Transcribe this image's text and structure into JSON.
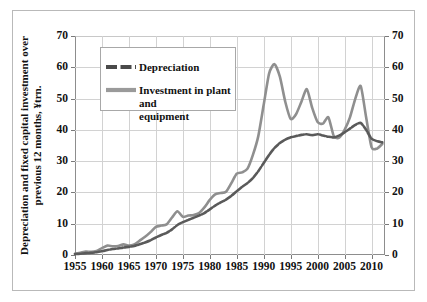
{
  "chart_data": {
    "type": "line",
    "title": "",
    "subtitle": "",
    "xlabel": "",
    "ylabel": "Depreciation and fixed capital investment over\nprevious 12 months, ¥trn.",
    "ylabel_right": "",
    "xlim": [
      1955,
      2012.5
    ],
    "ylim": [
      0,
      70
    ],
    "ytick_step": 10,
    "xtick_step": 5,
    "grid": true,
    "grid_axes": "both",
    "legend_position": "upper-left-inside",
    "dual_axis": true,
    "axis_left_ticks": [
      "0",
      "10",
      "20",
      "30",
      "40",
      "50",
      "60",
      "70"
    ],
    "axis_right_ticks": [
      "0",
      "10",
      "20",
      "30",
      "40",
      "50",
      "60",
      "70"
    ],
    "xtick_labels": [
      "1955",
      "1960",
      "1965",
      "1970",
      "1975",
      "1980",
      "1985",
      "1990",
      "1995",
      "2000",
      "2005",
      "2010"
    ],
    "xtick_values": [
      1955,
      1960,
      1965,
      1970,
      1975,
      1980,
      1985,
      1990,
      1995,
      2000,
      2005,
      2010
    ],
    "series": [
      {
        "name": "Depreciation",
        "color": "#5a5a5a",
        "style": "dashed",
        "legend_swatch": "dashed-line-swatch",
        "x": [
          1955,
          1956,
          1957,
          1958,
          1959,
          1960,
          1961,
          1962,
          1963,
          1964,
          1965,
          1966,
          1967,
          1968,
          1969,
          1970,
          1971,
          1972,
          1973,
          1974,
          1975,
          1976,
          1977,
          1978,
          1979,
          1980,
          1981,
          1982,
          1983,
          1984,
          1985,
          1986,
          1987,
          1988,
          1989,
          1990,
          1991,
          1992,
          1993,
          1994,
          1995,
          1996,
          1997,
          1998,
          1999,
          2000,
          2001,
          2002,
          2003,
          2004,
          2005,
          2006,
          2007,
          2008,
          2009,
          2010,
          2011,
          2012
        ],
        "values": [
          0.3,
          0.4,
          0.6,
          0.7,
          0.9,
          1.2,
          1.6,
          1.9,
          2.1,
          2.4,
          2.6,
          2.9,
          3.4,
          4.0,
          4.7,
          5.6,
          6.4,
          7.1,
          8.2,
          9.6,
          10.5,
          11.2,
          11.9,
          12.6,
          13.4,
          14.6,
          15.8,
          16.8,
          17.7,
          18.9,
          20.4,
          21.8,
          23.0,
          24.6,
          26.8,
          29.4,
          32.0,
          34.2,
          35.8,
          36.9,
          37.6,
          38.0,
          38.4,
          38.6,
          38.3,
          38.6,
          38.2,
          37.8,
          37.6,
          38.2,
          39.2,
          40.4,
          41.6,
          42.2,
          40.0,
          37.2,
          36.4,
          36.0
        ]
      },
      {
        "name": "Investment in plant and equipment",
        "color": "#8f8f8f",
        "style": "solid",
        "legend_swatch": "solid-line-swatch",
        "x": [
          1955,
          1956,
          1957,
          1958,
          1959,
          1960,
          1961,
          1962,
          1963,
          1964,
          1965,
          1966,
          1967,
          1968,
          1969,
          1970,
          1971,
          1972,
          1973,
          1974,
          1975,
          1976,
          1977,
          1978,
          1979,
          1980,
          1981,
          1982,
          1983,
          1984,
          1985,
          1986,
          1987,
          1988,
          1989,
          1990,
          1991,
          1992,
          1993,
          1994,
          1995,
          1996,
          1997,
          1998,
          1999,
          2000,
          2001,
          2002,
          2003,
          2004,
          2005,
          2006,
          2007,
          2008,
          2009,
          2010,
          2011,
          2012
        ],
        "values": [
          0.4,
          0.7,
          1.1,
          1.0,
          1.3,
          2.2,
          3.0,
          2.8,
          2.9,
          3.4,
          3.0,
          3.4,
          4.6,
          5.8,
          7.3,
          9.0,
          9.4,
          9.8,
          12.0,
          14.0,
          12.2,
          12.6,
          12.8,
          13.4,
          15.2,
          17.6,
          19.4,
          19.8,
          20.2,
          23.0,
          26.0,
          26.4,
          27.6,
          32.0,
          38.0,
          48.0,
          58.0,
          61.0,
          57.0,
          49.0,
          43.5,
          45.0,
          49.0,
          53.0,
          47.0,
          42.5,
          42.0,
          44.0,
          38.0,
          37.5,
          40.0,
          44.0,
          50.0,
          54.0,
          44.0,
          34.5,
          34.0,
          35.5
        ]
      }
    ],
    "annotations": [],
    "notes": {
      "peaks": {
        "investment_1992_peak": 61,
        "investment_1995_trough": 43.5,
        "investment_1998_peak": 53,
        "investment_2008_peak": 54,
        "investment_2010_trough": 34,
        "depreciation_2008_peak": 42.2
      }
    }
  },
  "legend": {
    "entries": [
      {
        "label": "Depreciation"
      },
      {
        "label": "Investment in plant and\nequipment"
      }
    ]
  },
  "colors": {
    "depreciation": "#5a5a5a",
    "investment": "#8f8f8f",
    "gridline": "#d2d2d2",
    "axis": "#8d8d8d",
    "frame": "#b9b9b9",
    "text": "#111111",
    "background": "#ffffff"
  }
}
